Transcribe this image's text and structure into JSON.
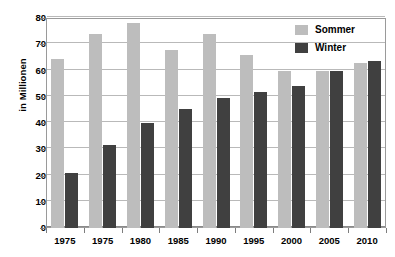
{
  "chart_data": {
    "type": "bar",
    "title": "",
    "subtitle": "",
    "xlabel": "",
    "ylabel": "in Millionen",
    "ylim": [
      0,
      80
    ],
    "ytick_step": 10,
    "yticks": [
      80,
      70,
      60,
      50,
      40,
      30,
      20,
      10,
      0
    ],
    "grid": true,
    "legend_position": "top-right-inside",
    "categories": [
      "1975",
      "1975",
      "1980",
      "1985",
      "1990",
      "1995",
      "2000",
      "2005",
      "2010"
    ],
    "series": [
      {
        "name": "Sommer",
        "color": "#bdbdbd",
        "values": [
          64.5,
          74,
          78,
          68,
          74,
          66,
          60,
          60,
          63
        ]
      },
      {
        "name": "Winter",
        "color": "#404040",
        "values": [
          21,
          31.5,
          40,
          45.5,
          49.5,
          52,
          54,
          60,
          63.5
        ]
      }
    ]
  },
  "colors": {
    "sommer": "#bdbdbd",
    "winter": "#404040",
    "gridline": "#b9b9b9",
    "frame": "#9a9a9a",
    "background": "#ffffff"
  }
}
